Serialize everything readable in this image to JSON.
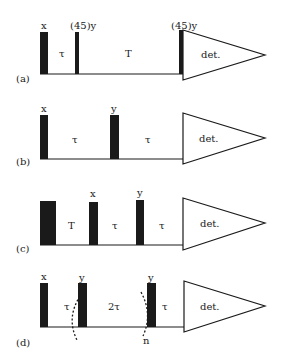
{
  "figure": {
    "panels": [
      {
        "id": "a",
        "label": "(a)",
        "pulse_labels": [
          "x",
          "(45)y",
          "(45)y"
        ],
        "delays": [
          "τ",
          "T"
        ],
        "detection": "det."
      },
      {
        "id": "b",
        "label": "(b)",
        "pulse_labels": [
          "x",
          "y"
        ],
        "delays": [
          "τ",
          "τ"
        ],
        "detection": "det."
      },
      {
        "id": "c",
        "label": "(c)",
        "pulse_labels": [
          "x",
          "y"
        ],
        "delays": [
          "T",
          "τ",
          "τ"
        ],
        "detection": "det."
      },
      {
        "id": "d",
        "label": "(d)",
        "pulse_labels": [
          "x",
          "y",
          "y"
        ],
        "delays": [
          "τ",
          "2τ",
          "τ"
        ],
        "detection": "det.",
        "loop_label": "n"
      }
    ]
  }
}
